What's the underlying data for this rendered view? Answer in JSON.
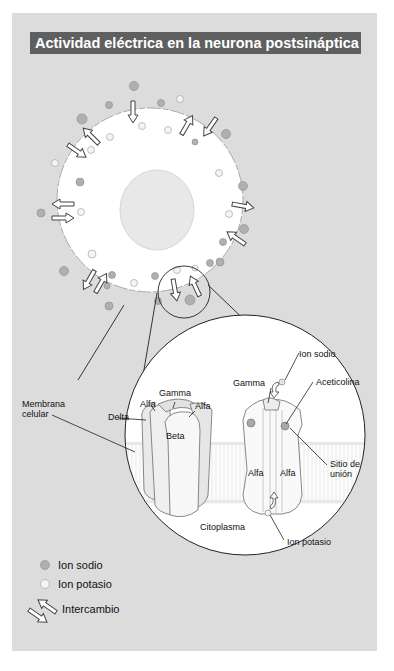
{
  "title": "Actividad eléctrica en la neurona postsináptica",
  "colors": {
    "panel": "#dcdcdc",
    "title_bg": "#5f5f5f",
    "title_text": "#ffffff",
    "cell": "#ffffff",
    "nucleus": "#e6e6e6",
    "sodium": "#b0b0b0",
    "potassium": "#f4f4f4",
    "membrane_band": "#f2f2f2"
  },
  "inset_labels": {
    "membrana_line1": "Membrana",
    "membrana_line2": "celular",
    "delta": "Delta",
    "alfa_left_1": "Alfa",
    "gamma_left": "Gamma",
    "alfa_left_2": "Alfa",
    "beta": "Beta",
    "ion_sodio": "Ion sodio",
    "gamma_right": "Gamma",
    "acetilcolina": "Aceticolina",
    "alfa_right_1": "Alfa",
    "alfa_right_2": "Alfa",
    "sitio_line1": "Sitio de",
    "sitio_line2": "unión",
    "citoplasma": "Citoplasma",
    "ion_potasio": "Ion potasio"
  },
  "legend": {
    "items": [
      {
        "icon": "sodium-ion-icon",
        "label": "Ion sodio"
      },
      {
        "icon": "potassium-ion-icon",
        "label": "Ion potasio"
      },
      {
        "icon": "exchange-arrows-icon",
        "label": "Intercambio"
      }
    ]
  }
}
